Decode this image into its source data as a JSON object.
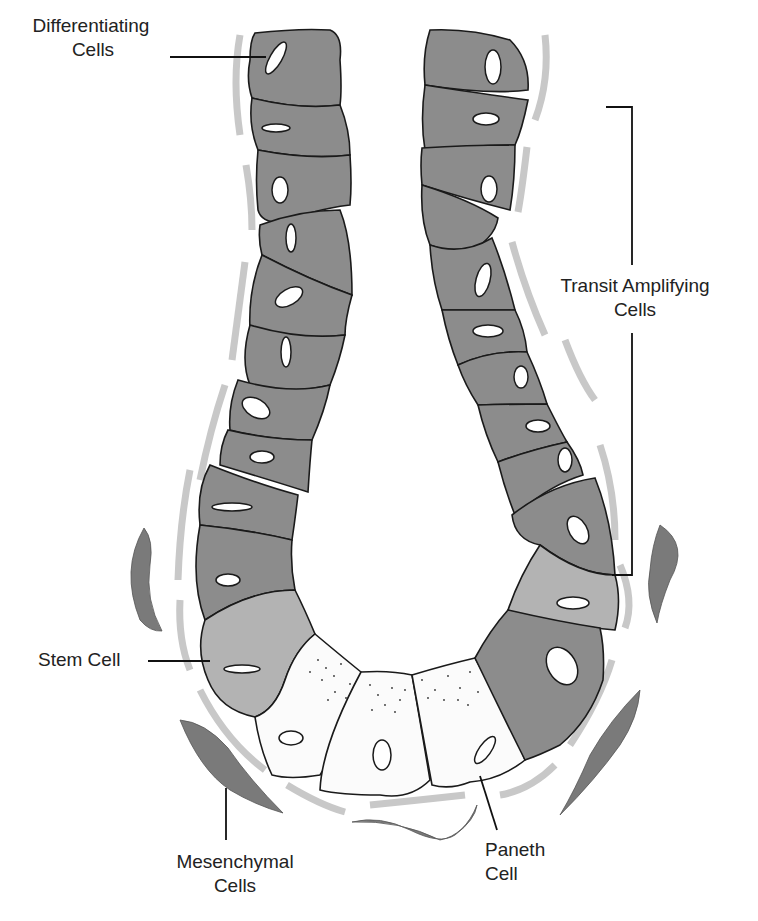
{
  "diagram": {
    "labels": {
      "differentiating": {
        "line1": "Differentiating",
        "line2": "Cells"
      },
      "transit_amplifying": {
        "line1": "Transit Amplifying",
        "line2": "Cells"
      },
      "stem": {
        "line1": "Stem Cell"
      },
      "mesenchymal": {
        "line1": "Mesenchymal",
        "line2": "Cells"
      },
      "paneth": {
        "line1": "Paneth",
        "line2": "Cell"
      }
    },
    "colors": {
      "differentiating_cell": "#8c8c8c",
      "stem_cell": "#b3b3b3",
      "paneth_cell": "#fbfbfb",
      "basement_membrane": "#c8c8c8",
      "mesenchymal_cell": "#7a7a7a",
      "outline": "#1a1a1a"
    }
  }
}
